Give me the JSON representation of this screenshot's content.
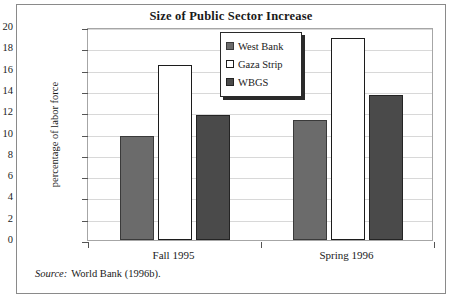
{
  "figure": {
    "title": "Size of Public Sector Increase",
    "source_word": "Source:",
    "source_text": "World Bank (1996b)."
  },
  "legend": {
    "items": [
      {
        "label": "West Bank",
        "swatch": "west",
        "color": "#6b6b6b"
      },
      {
        "label": "Gaza Strip",
        "swatch": "gaza",
        "color": "#ffffff"
      },
      {
        "label": "WBGS",
        "swatch": "wbgs",
        "color": "#4a4a4a"
      }
    ]
  },
  "chart_data": {
    "type": "bar",
    "title": "Size of Public Sector Increase",
    "xlabel": "",
    "ylabel": "percentage of labor force",
    "categories": [
      "Fall 1995",
      "Spring 1996"
    ],
    "series": [
      {
        "name": "West Bank",
        "values": [
          9.8,
          11.3
        ],
        "color": "#6b6b6b"
      },
      {
        "name": "Gaza Strip",
        "values": [
          16.4,
          19.0
        ],
        "color": "#ffffff"
      },
      {
        "name": "WBGS",
        "values": [
          11.7,
          13.6
        ],
        "color": "#4a4a4a"
      }
    ],
    "ylim": [
      0,
      20
    ],
    "yticks": [
      0,
      2,
      4,
      6,
      8,
      10,
      12,
      14,
      16,
      18,
      20
    ],
    "ytick_labels": [
      "0",
      "2",
      "4",
      "6",
      "8",
      "10",
      "12",
      "14",
      "16",
      "18",
      "20"
    ],
    "grid": true,
    "legend_position": "upper center"
  }
}
